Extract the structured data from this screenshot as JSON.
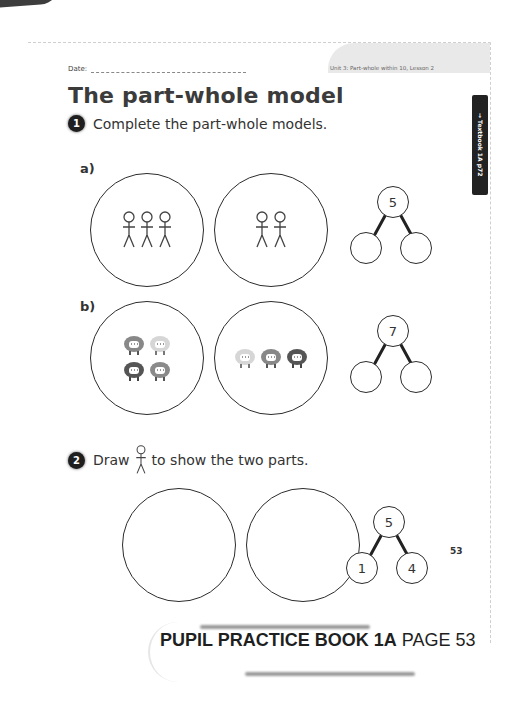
{
  "header": {
    "date_label": "Date:",
    "unit_label": "Unit 3: Part-whole within 10, Lesson 2",
    "title": "The part-whole model",
    "side_tab": "→ Textbook 1A p72"
  },
  "question1": {
    "number": "1",
    "prompt": "Complete the part-whole models.",
    "part_a": {
      "label": "a)",
      "left_circle_figures": 3,
      "right_circle_figures": 2,
      "whole": "5",
      "part_left": "",
      "part_right": ""
    },
    "part_b": {
      "label": "b)",
      "left_circle_sheep": 4,
      "right_circle_sheep": 3,
      "whole": "7",
      "part_left": "",
      "part_right": ""
    }
  },
  "question2": {
    "number": "2",
    "prompt_before": "Draw",
    "prompt_after": "to show the two parts.",
    "whole": "5",
    "part_left": "1",
    "part_right": "4"
  },
  "page_number": "53",
  "footer": {
    "book": "PUPIL PRACTICE BOOK 1A",
    "page": "PAGE 53"
  },
  "colors": {
    "ink": "#2c2c2c",
    "tab_bg": "#222222",
    "header_band": "#e9e9e9"
  }
}
